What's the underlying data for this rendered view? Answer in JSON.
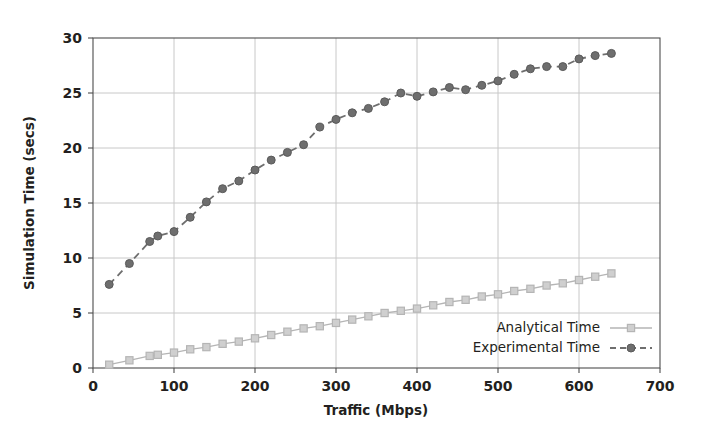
{
  "chart_data": {
    "type": "line",
    "title": "",
    "xlabel": "Traffic (Mbps)",
    "ylabel": "Simulation Time (secs)",
    "xlim": [
      0,
      700
    ],
    "ylim": [
      0,
      30
    ],
    "xticks": [
      0,
      100,
      200,
      300,
      400,
      500,
      600,
      700
    ],
    "yticks": [
      0,
      5,
      10,
      15,
      20,
      25,
      30
    ],
    "grid": true,
    "legend_position": "lower right",
    "x": [
      20,
      45,
      70,
      80,
      100,
      120,
      140,
      160,
      180,
      200,
      220,
      240,
      260,
      280,
      300,
      320,
      340,
      360,
      380,
      400,
      420,
      440,
      460,
      480,
      500,
      520,
      540,
      560,
      580,
      600,
      620,
      640
    ],
    "series": [
      {
        "name": "Analytical Time",
        "color": "#b5b5b5",
        "marker": "square",
        "linestyle": "solid",
        "values": [
          0.3,
          0.7,
          1.1,
          1.2,
          1.4,
          1.7,
          1.9,
          2.2,
          2.4,
          2.7,
          3.0,
          3.3,
          3.6,
          3.8,
          4.1,
          4.4,
          4.7,
          5.0,
          5.2,
          5.4,
          5.7,
          6.0,
          6.2,
          6.5,
          6.7,
          7.0,
          7.2,
          7.5,
          7.7,
          8.0,
          8.3,
          8.6
        ]
      },
      {
        "name": "Experimental Time",
        "color": "#6e6e6e",
        "marker": "circle",
        "linestyle": "dashed",
        "values": [
          7.6,
          9.5,
          11.5,
          12.0,
          12.4,
          13.7,
          15.1,
          16.3,
          17.0,
          18.0,
          18.9,
          19.6,
          20.3,
          21.9,
          22.6,
          23.2,
          23.6,
          24.2,
          25.0,
          24.7,
          25.1,
          25.5,
          25.3,
          25.7,
          26.1,
          26.7,
          27.2,
          27.4,
          27.4,
          28.1,
          28.4,
          28.6
        ]
      }
    ]
  },
  "legend": {
    "entries": [
      {
        "label": "Analytical Time"
      },
      {
        "label": "Experimental Time"
      }
    ]
  },
  "axes": {
    "x_tick_labels": [
      "0",
      "100",
      "200",
      "300",
      "400",
      "500",
      "600",
      "700"
    ],
    "y_tick_labels": [
      "0",
      "5",
      "10",
      "15",
      "20",
      "25",
      "30"
    ]
  },
  "style": {
    "plot_border_color": "#4d4d4d",
    "grid_color": "#c8c8c8",
    "background": "#ffffff"
  }
}
